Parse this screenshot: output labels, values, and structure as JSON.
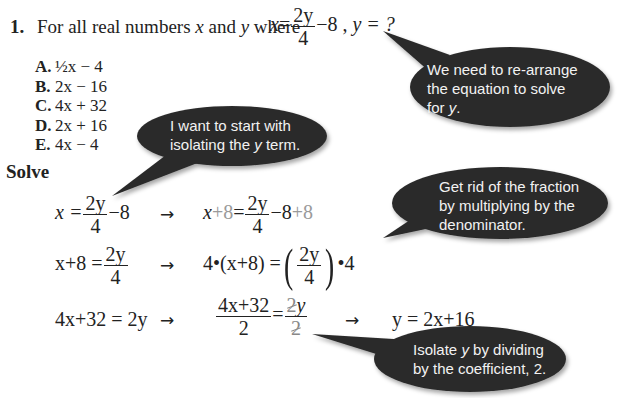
{
  "question": {
    "number": "1.",
    "prompt_prefix": "For all real numbers",
    "var_x": "x",
    "and": "and",
    "var_y": "y",
    "where": "where",
    "equation": {
      "lhs": "x",
      "eq": "=",
      "num": "2y",
      "den": "4",
      "tail": "−8 ,",
      "ask": "y = ?"
    },
    "choices": [
      {
        "letter": "A.",
        "text": "½x − 4"
      },
      {
        "letter": "B.",
        "text": "2x − 16"
      },
      {
        "letter": "C.",
        "text": "4x + 32"
      },
      {
        "letter": "D.",
        "text": "2x + 16"
      },
      {
        "letter": "E.",
        "text": "4x − 4"
      }
    ]
  },
  "solve_heading": "Solve",
  "steps": {
    "row1": {
      "left": {
        "lhs": "x =",
        "num": "2y",
        "den": "4",
        "tail": "−8"
      },
      "arrow": "→",
      "right": {
        "lhs_x": "x",
        "lhs_plus8": "+8",
        "eq": "=",
        "num": "2y",
        "den": "4",
        "tail": "−8",
        "tail_plus8": "+8"
      }
    },
    "row2": {
      "left": {
        "lhs": "x+8 =",
        "num": "2y",
        "den": "4"
      },
      "arrow": "→",
      "right": {
        "lhs": "4•(x+8) =",
        "num": "2y",
        "den": "4",
        "tail": "•4"
      }
    },
    "row3": {
      "left": "4x+32 = 2y",
      "arrow1": "→",
      "mid": {
        "num_left": "4x+32",
        "den_left": "2",
        "eq": "=",
        "num_right_struck": "2",
        "num_right_var": "y",
        "den_right_struck": "2"
      },
      "arrow2": "→",
      "result": "y = 2x+16"
    }
  },
  "bubbles": [
    {
      "id": "rearrange",
      "lines": [
        "We need to re-arrange",
        "the equation to solve"
      ],
      "last_prefix": "for ",
      "last_var": "y",
      "last_suffix": "."
    },
    {
      "id": "isolate-term",
      "line1": "I want to start with",
      "line2_prefix": "isolating the ",
      "line2_var": "y",
      "line2_suffix": " term."
    },
    {
      "id": "fraction",
      "lines": [
        "Get rid of the fraction",
        "by multiplying by the",
        "denominator."
      ]
    },
    {
      "id": "divide",
      "line1_prefix": "Isolate ",
      "line1_var": "y",
      "line1_suffix": " by dividing",
      "line2": "by the coefficient, 2."
    }
  ],
  "colors": {
    "bubble_fill": "#2b2b2b",
    "bubble_text": "#f2f2f2",
    "text": "#222222",
    "added_term": "#9a9a9a"
  }
}
